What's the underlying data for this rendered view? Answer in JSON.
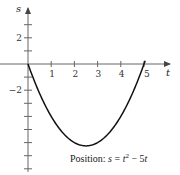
{
  "chart_data": {
    "type": "line",
    "title": "",
    "xlabel": "t",
    "ylabel": "s",
    "annotation": "Position: s = t² − 5t",
    "annotation_parts": {
      "prefix": "Position: ",
      "s": "s",
      "eq": " = ",
      "t": "t",
      "sup": "2",
      "rest": " − 5",
      "t2": "t"
    },
    "equation": "s = t^2 - 5t",
    "x_ticks": [
      1,
      2,
      3,
      4,
      5
    ],
    "x_tick_labels": [
      "1",
      "2",
      "3",
      "4",
      "5"
    ],
    "y_ticks": [
      3,
      2,
      1,
      -1,
      -2,
      -3,
      -4,
      -5,
      -6,
      -7,
      -8
    ],
    "y_tick_labels": {
      "2": "2",
      "-2": "−2"
    },
    "xlim": [
      0,
      6
    ],
    "ylim": [
      -8,
      4
    ],
    "grid": false,
    "series": [
      {
        "name": "Position",
        "x": [
          0,
          0.5,
          1,
          1.5,
          2,
          2.5,
          3,
          3.5,
          4,
          4.5,
          5
        ],
        "values": [
          0,
          -2.25,
          -4,
          -5.25,
          -6,
          -6.25,
          -6,
          -5.25,
          -4,
          -2.25,
          0
        ]
      }
    ],
    "colors": {
      "curve": "#111111",
      "axis": "#555555"
    }
  }
}
